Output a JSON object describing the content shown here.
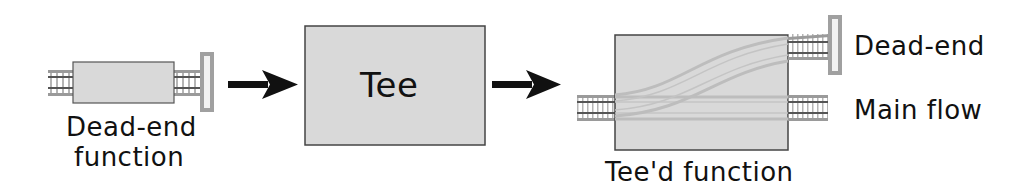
{
  "diagram": {
    "stage1": {
      "caption_line1": "Dead-end",
      "caption_line2": "function",
      "icon": "dead-end-track-icon"
    },
    "stage2": {
      "box_label": "Tee"
    },
    "stage3": {
      "caption": "Tee'd function",
      "branch_labels": {
        "dead_end": "Dead-end",
        "main_flow": "Main flow"
      },
      "icon": "branching-track-icon"
    },
    "arrows": [
      "arrow-right-icon",
      "arrow-right-icon"
    ],
    "colors": {
      "box_fill": "#d9d9d9",
      "box_border": "#444444",
      "track_rail": "#9a9a9a",
      "track_sleeper": "#b0b0b0",
      "buffer_stop": "#a0a0a0",
      "arrow": "#111111",
      "text": "#111111"
    }
  }
}
